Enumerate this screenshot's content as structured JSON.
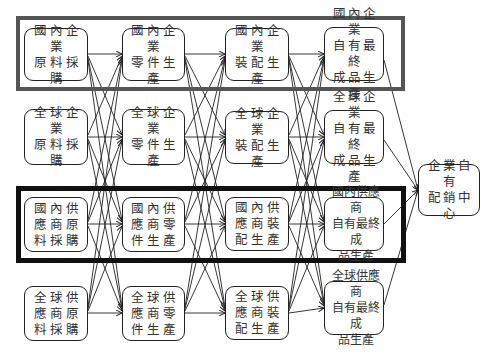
{
  "diagram": {
    "columns": [
      {
        "stage": "raw-material-procurement",
        "nodes": [
          {
            "id": "c1r1",
            "label": "國內企業\n原料採購"
          },
          {
            "id": "c1r2",
            "label": "全球企業\n原料採購"
          },
          {
            "id": "c1r3",
            "label": "國內供\n應商原\n料採購"
          },
          {
            "id": "c1r4",
            "label": "全球供\n應商原\n料採購"
          }
        ]
      },
      {
        "stage": "parts-production",
        "nodes": [
          {
            "id": "c2r1",
            "label": "國內企業\n零件生產"
          },
          {
            "id": "c2r2",
            "label": "全球企業\n零件生產"
          },
          {
            "id": "c2r3",
            "label": "國內供\n應商零\n件生產"
          },
          {
            "id": "c2r4",
            "label": "全球供\n應商零\n件生產"
          }
        ]
      },
      {
        "stage": "assembly-production",
        "nodes": [
          {
            "id": "c3r1",
            "label": "國內企業\n裝配生產"
          },
          {
            "id": "c3r2",
            "label": "全球企業\n裝配生產"
          },
          {
            "id": "c3r3",
            "label": "國內供\n應商裝\n配生產"
          },
          {
            "id": "c3r4",
            "label": "全球供\n應商裝\n配生產"
          }
        ]
      },
      {
        "stage": "final-product-production",
        "nodes": [
          {
            "id": "c4r1",
            "label": "國內企業\n自有最終\n成品生產"
          },
          {
            "id": "c4r2",
            "label": "全球企業\n自有最終\n成品生產"
          },
          {
            "id": "c4r3",
            "label": "國內供應商\n自有最終成\n品生產"
          },
          {
            "id": "c4r4",
            "label": "全球供應商\n自有最終成\n品生產"
          }
        ]
      }
    ],
    "sink": {
      "id": "sink",
      "label": "企業自有\n配銷中心"
    },
    "highlight_frames": [
      {
        "name": "domestic-enterprise-row",
        "row": 1,
        "style": "gray-thick"
      },
      {
        "name": "domestic-supplier-row",
        "row": 3,
        "style": "black-thick"
      }
    ],
    "edges": "all-to-all between adjacent columns; every final-product node connects to sink",
    "colors": {
      "line": "#222222",
      "frame_top": "#555555",
      "frame_bottom": "#111111",
      "text": "#333333"
    }
  }
}
